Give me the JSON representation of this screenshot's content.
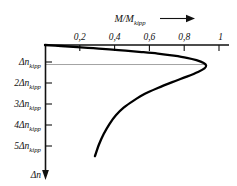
{
  "chart_data": {
    "type": "line",
    "title": "",
    "xlabel": "M/M kipp",
    "ylabel": "Δn",
    "xlim": [
      0,
      1.08
    ],
    "ylim": [
      0,
      6.2
    ],
    "grid": false,
    "legend": null,
    "x_ticks": [
      "0,2",
      "0,4",
      "0,6",
      "0,8",
      "1"
    ],
    "x_tick_values": [
      0.2,
      0.4,
      0.6,
      0.8,
      1.0
    ],
    "y_ticks": [
      "Δn kipp",
      "2Δn kipp",
      "3Δn kipp",
      "4Δn kipp",
      "5Δn kipp"
    ],
    "y_tick_values": [
      1,
      2,
      3,
      4,
      5
    ],
    "series": [
      {
        "name": "Kloss torque-slip characteristic",
        "x": [
          0.0,
          0.1,
          0.2,
          0.3,
          0.4,
          0.5,
          0.6,
          0.7,
          0.8,
          0.88,
          0.94,
          0.985,
          1.0,
          0.99,
          0.95,
          0.88,
          0.79,
          0.7,
          0.62,
          0.55,
          0.49,
          0.44,
          0.4,
          0.365,
          0.335,
          0.31
        ],
        "y": [
          0.0,
          0.05,
          0.105,
          0.165,
          0.225,
          0.29,
          0.36,
          0.44,
          0.55,
          0.66,
          0.78,
          0.92,
          1.05,
          1.2,
          1.38,
          1.62,
          1.9,
          2.2,
          2.5,
          2.85,
          3.2,
          3.6,
          4.05,
          4.55,
          5.1,
          5.7
        ]
      }
    ],
    "annotations": [
      {
        "name": "breakdown-gridline",
        "y_value": 1.0,
        "x_from": 0.0,
        "x_to": 1.0
      }
    ]
  },
  "axis_labels": {
    "x_title_main": "M/M",
    "x_title_sub": "kipp",
    "y_arrow_label": "Δn",
    "y_tick_items": [
      {
        "prefix": "",
        "delta": "Δn",
        "sub": "kipp"
      },
      {
        "prefix": "2",
        "delta": "Δn",
        "sub": "kipp"
      },
      {
        "prefix": "3",
        "delta": "Δn",
        "sub": "kipp"
      },
      {
        "prefix": "4",
        "delta": "Δn",
        "sub": "kipp"
      },
      {
        "prefix": "5",
        "delta": "Δn",
        "sub": "kipp"
      }
    ]
  },
  "colors": {
    "curve": "#000000",
    "axis": "#111111",
    "gridline": "#8a8a8a",
    "background": "#ffffff"
  }
}
